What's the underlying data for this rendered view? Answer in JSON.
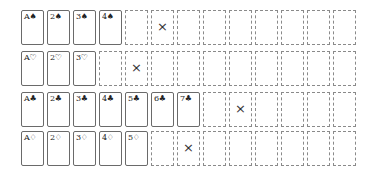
{
  "game": {
    "columns": 13,
    "rows": [
      {
        "suit": "spades",
        "suit_symbol": "♠",
        "cards": [
          "A♠",
          "2♠",
          "3♠",
          "4♠"
        ],
        "target_index": 5
      },
      {
        "suit": "hearts",
        "suit_symbol": "♡",
        "cards": [
          "A♡",
          "2♡",
          "3♡"
        ],
        "target_index": 4
      },
      {
        "suit": "clubs",
        "suit_symbol": "♣",
        "cards": [
          "A♣",
          "2♣",
          "3♣",
          "4♣",
          "5♣",
          "6♣",
          "7♣"
        ],
        "target_index": 8
      },
      {
        "suit": "diamonds",
        "suit_symbol": "♢",
        "cards": [
          "A♢",
          "2♢",
          "3♢",
          "4♢",
          "5♢"
        ],
        "target_index": 6
      }
    ],
    "target_mark": "×",
    "colors": {
      "card_border": "#6a6a6a",
      "empty_border": "#8a8a8a",
      "background": "#ffffff"
    }
  }
}
